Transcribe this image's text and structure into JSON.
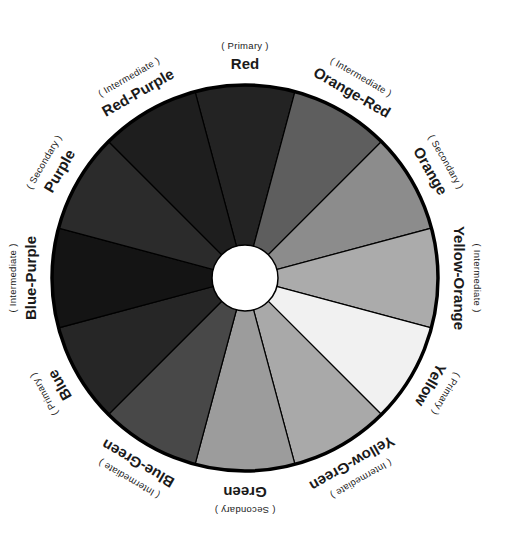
{
  "center_hole_color": "#ffffff",
  "outline_color": "#000000",
  "segments": [
    {
      "name": "Red",
      "category": "( Primary )",
      "fill": "#232323"
    },
    {
      "name": "Orange-Red",
      "category": "( Intermediate )",
      "fill": "#5e5e5e"
    },
    {
      "name": "Orange",
      "category": "( Secondary )",
      "fill": "#8c8c8c"
    },
    {
      "name": "Yellow-Orange",
      "category": "( Intermediate )",
      "fill": "#ababab"
    },
    {
      "name": "Yellow",
      "category": "( Primary )",
      "fill": "#f1f1f1"
    },
    {
      "name": "Yellow-Green",
      "category": "( Intermediate )",
      "fill": "#a9a9a9"
    },
    {
      "name": "Green",
      "category": "( Secondary )",
      "fill": "#9c9c9c"
    },
    {
      "name": "Blue-Green",
      "category": "( Intermediate )",
      "fill": "#484848"
    },
    {
      "name": "Blue",
      "category": "( Primary )",
      "fill": "#262626"
    },
    {
      "name": "Blue-Purple",
      "category": "( Intermediate )",
      "fill": "#141414"
    },
    {
      "name": "Purple",
      "category": "( Secondary )",
      "fill": "#2b2b2b"
    },
    {
      "name": "Red-Purple",
      "category": "( Intermediate )",
      "fill": "#1e1e1e"
    }
  ]
}
